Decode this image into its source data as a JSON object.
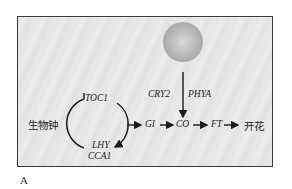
{
  "diagram": {
    "light_source": {
      "icon": "light-sphere"
    },
    "clock": {
      "label": "生物钟",
      "genes": {
        "top": "TOC1",
        "bottom_1": "LHY",
        "bottom_2": "CCA1"
      }
    },
    "photoreceptors": {
      "left": "CRY2",
      "right": "PHYA"
    },
    "pathway": [
      "GI",
      "CO",
      "FT"
    ],
    "outcome": "开花"
  },
  "panel_label": "A",
  "colors": {
    "background": "#e6e6e6",
    "border": "#3a3a3a",
    "ink": "#222222"
  }
}
